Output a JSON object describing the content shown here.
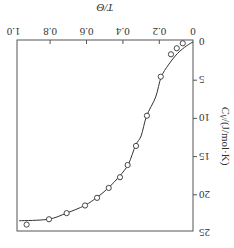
{
  "chart_data": {
    "type": "line",
    "title": "",
    "xlabel": "T/Θ",
    "ylabel": "C_V/(J/mol·K)",
    "xlim": [
      0,
      1.0
    ],
    "ylim": [
      0,
      25
    ],
    "x_ticks": [
      "0",
      "0.2",
      "0.4",
      "0.6",
      "0.8",
      "1.0"
    ],
    "y_ticks": [
      "0",
      "5",
      "10",
      "15",
      "20",
      "25"
    ],
    "grid": false,
    "legend": null,
    "orientation": "rotated 180°",
    "series": [
      {
        "name": "Debye model (curve)",
        "style": "line",
        "x": [
          0.0,
          0.05,
          0.1,
          0.15,
          0.19,
          0.22,
          0.27,
          0.3,
          0.33,
          0.37,
          0.42,
          0.48,
          0.54,
          0.61,
          0.71,
          0.81,
          0.97
        ],
        "y": [
          0.0,
          0.5,
          1.5,
          3.0,
          4.6,
          7.2,
          9.7,
          12.3,
          13.5,
          16.0,
          17.6,
          19.1,
          20.3,
          21.4,
          22.4,
          23.2,
          23.4
        ]
      },
      {
        "name": "Experimental data",
        "style": "open-circle markers",
        "x": [
          0.071,
          0.104,
          0.136,
          0.192,
          0.268,
          0.328,
          0.374,
          0.416,
          0.478,
          0.542,
          0.608,
          0.709,
          0.806,
          0.929
        ],
        "y": [
          0.17,
          0.82,
          1.61,
          4.54,
          9.65,
          13.6,
          16.1,
          17.7,
          19.1,
          20.4,
          21.4,
          22.4,
          23.2,
          23.9
        ]
      }
    ]
  },
  "axes": {
    "x_title_text": "T/Θ",
    "y_title_main": "C",
    "y_title_sub": "V",
    "y_title_rest": "/(J/mol·K)"
  }
}
